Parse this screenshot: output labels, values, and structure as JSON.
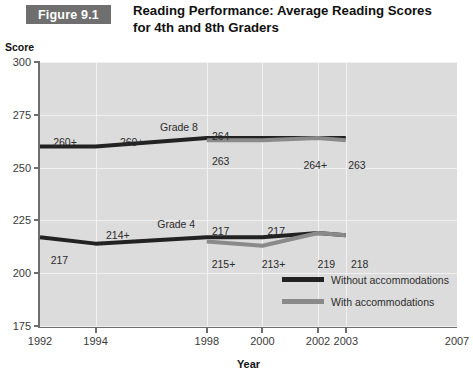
{
  "figure": {
    "badge_label": "Figure 9.1",
    "title_line1": "Reading Performance: Average Reading Scores",
    "title_line2": "for 4th and 8th Graders",
    "badge_bg": "#6f6f6f",
    "badge_text_color": "#ffffff",
    "plot_bg": "#dcdcdc"
  },
  "chart_data": {
    "type": "line",
    "title": "Reading Performance: Average Reading Scores for 4th and 8th Graders",
    "xlabel": "Year",
    "ylabel": "Score",
    "xlim": [
      1992,
      2007
    ],
    "ylim": [
      175,
      300
    ],
    "yticks": [
      300,
      275,
      250,
      225,
      200,
      175
    ],
    "xticks": [
      1992,
      1994,
      1998,
      2000,
      2002,
      2003,
      2007
    ],
    "grid": true,
    "legend_position": "bottom-right",
    "colors": {
      "without_accommodations": "#222222",
      "with_accommodations": "#8a8a8a"
    },
    "series": [
      {
        "name": "Without accommodations",
        "color": "#222222",
        "x": [
          1992,
          1994,
          1998,
          2000,
          2002,
          2003
        ],
        "values": [
          260,
          260,
          264,
          264,
          264,
          264
        ]
      },
      {
        "name": "With accommodations",
        "color": "#8a8a8a",
        "x": [
          1998,
          2000,
          2002,
          2003
        ],
        "values": [
          263,
          263,
          264,
          263
        ]
      },
      {
        "name": "Without accommodations",
        "color": "#222222",
        "x": [
          1992,
          1994,
          1998,
          2000,
          2002,
          2003
        ],
        "values": [
          217,
          214,
          217,
          217,
          219,
          218
        ]
      },
      {
        "name": "With accommodations",
        "color": "#8a8a8a",
        "x": [
          1998,
          2000,
          2002,
          2003
        ],
        "values": [
          215,
          213,
          219,
          218
        ]
      }
    ],
    "annotations": {
      "grade8_label": "Grade 8",
      "grade4_label": "Grade 4",
      "grade8_upper": [
        "260+",
        "260+",
        "264",
        "264+"
      ],
      "grade8_lower": [
        "263",
        "263"
      ],
      "grade4_upper": [
        "214+",
        "217",
        "217"
      ],
      "grade4_lower": [
        "217",
        "215+",
        "213+",
        "219",
        "218"
      ]
    }
  },
  "ytick_labels": [
    "300",
    "275",
    "250",
    "225",
    "200",
    "175"
  ],
  "xtick_labels": [
    "1992",
    "1994",
    "1998",
    "2000",
    "2002",
    "2003",
    "2007"
  ],
  "axis": {
    "y_title": "Score",
    "x_title": "Year"
  },
  "labels": {
    "grade8": "Grade 8",
    "grade4": "Grade 4",
    "g8_1992": "260+",
    "g8_1994": "260+",
    "g8_1998_top": "264",
    "g8_1998_bot": "263",
    "g8_2002": "264+",
    "g8_2003": "263",
    "g4_1992": "217",
    "g4_1994": "214+",
    "g4_1998_top": "217",
    "g4_1998_bot": "215+",
    "g4_2000_top": "217",
    "g4_2000_bot": "213+",
    "g4_2002": "219",
    "g4_2003": "218"
  },
  "legend": {
    "items": [
      {
        "label": "Without accommodations",
        "color": "#222222"
      },
      {
        "label": "With accommodations",
        "color": "#8a8a8a"
      }
    ]
  }
}
